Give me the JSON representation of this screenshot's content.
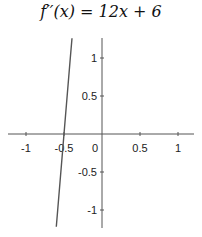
{
  "chart_data": {
    "type": "line",
    "xlabel": "",
    "ylabel": "",
    "xlim": [
      -1.25,
      1.22
    ],
    "ylim": [
      -1.22,
      1.26
    ],
    "grid": false,
    "x_ticks": [
      -1,
      -0.5,
      0,
      0.5,
      1
    ],
    "x_tick_labels": [
      "-1",
      "-0.5",
      "0",
      "0.5",
      "1"
    ],
    "y_ticks": [
      1,
      0.5,
      -0.5,
      -1
    ],
    "y_tick_labels": [
      "1",
      "0.5",
      "-0.5",
      "-1"
    ],
    "series": [
      {
        "name": "f''(x) = 12x + 6",
        "equation": "12x + 6",
        "x": [
          -0.6017,
          -0.5833,
          -0.5,
          -0.4167,
          -0.395
        ],
        "values": [
          -1.22,
          -1,
          0,
          1,
          1.26
        ],
        "color": "#555555"
      }
    ],
    "axis_color": "#555555"
  },
  "title_text": "f′′(x) = 12x + 6"
}
